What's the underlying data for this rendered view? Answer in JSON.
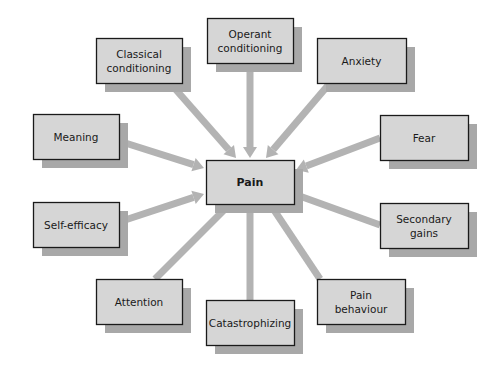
{
  "diagram": {
    "type": "influence-map",
    "colors": {
      "box_fill": "#d6d6d6",
      "box_border": "#1a1a1a",
      "shadow": "#a8a8a8",
      "connector": "#b3b3b3",
      "background": "#ffffff"
    },
    "center": {
      "id": "pain",
      "label": [
        "Pain"
      ]
    },
    "nodes": [
      {
        "id": "classical-conditioning",
        "label": [
          "Classical",
          "conditioning"
        ],
        "arrow": true
      },
      {
        "id": "operant-conditioning",
        "label": [
          "Operant",
          "conditioning"
        ],
        "arrow": true
      },
      {
        "id": "anxiety",
        "label": [
          "Anxiety"
        ],
        "arrow": true
      },
      {
        "id": "meaning",
        "label": [
          "Meaning"
        ],
        "arrow": true
      },
      {
        "id": "fear",
        "label": [
          "Fear"
        ],
        "arrow": true
      },
      {
        "id": "self-efficacy",
        "label": [
          "Self-efficacy"
        ],
        "arrow": true
      },
      {
        "id": "secondary-gains",
        "label": [
          "Secondary",
          "gains"
        ],
        "arrow": false
      },
      {
        "id": "attention",
        "label": [
          "Attention"
        ],
        "arrow": false
      },
      {
        "id": "catastrophizing",
        "label": [
          "Catastrophizing"
        ],
        "arrow": false
      },
      {
        "id": "pain-behaviour",
        "label": [
          "Pain",
          "behaviour"
        ],
        "arrow": false
      }
    ]
  }
}
